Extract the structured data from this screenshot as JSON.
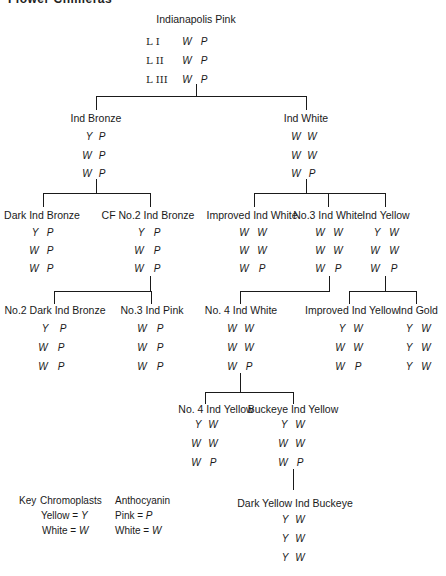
{
  "header": {
    "title": "Flower Chimeras"
  },
  "root": {
    "name": "Indianapolis Pink",
    "layers": [
      {
        "layer": "L I",
        "chromoplast": "W",
        "anthocyanin": "P"
      },
      {
        "layer": "L II",
        "chromoplast": "W",
        "anthocyanin": "P"
      },
      {
        "layer": "L III",
        "chromoplast": "W",
        "anthocyanin": "P"
      }
    ]
  },
  "nodes": {
    "ind_bronze": {
      "name": "Ind  Bronze",
      "rows": [
        [
          "Y",
          "P"
        ],
        [
          "W",
          "P"
        ],
        [
          "W",
          "P"
        ]
      ]
    },
    "ind_white": {
      "name": "Ind  White",
      "rows": [
        [
          "W",
          "W"
        ],
        [
          "W",
          "W"
        ],
        [
          "W",
          "P"
        ]
      ]
    },
    "dark_ind_bronze": {
      "name": "Dark Ind Bronze",
      "rows": [
        [
          "Y",
          "P"
        ],
        [
          "W",
          "P"
        ],
        [
          "W",
          "P"
        ]
      ]
    },
    "cf_no2_ind_bronze": {
      "name": "CF No.2  Ind  Bronze",
      "rows": [
        [
          "Y",
          "P"
        ],
        [
          "W",
          "P"
        ],
        [
          "W",
          "P"
        ]
      ]
    },
    "improved_ind_white": {
      "name": "Improved Ind White",
      "rows": [
        [
          "W",
          "W"
        ],
        [
          "W",
          "W"
        ],
        [
          "W",
          "P"
        ]
      ]
    },
    "no3_ind_white": {
      "name": "No.3 Ind White",
      "rows": [
        [
          "W",
          "W"
        ],
        [
          "W",
          "W"
        ],
        [
          "W",
          "P"
        ]
      ]
    },
    "ind_yellow": {
      "name": "Ind  Yellow",
      "rows": [
        [
          "Y",
          "W"
        ],
        [
          "W",
          "W"
        ],
        [
          "W",
          "P"
        ]
      ]
    },
    "no2_dark_ind_bronze": {
      "name": "No.2 Dark Ind Bronze",
      "rows": [
        [
          "Y",
          "P"
        ],
        [
          "W",
          "P"
        ],
        [
          "W",
          "P"
        ]
      ]
    },
    "no3_ind_pink": {
      "name": "No.3  Ind  Pink",
      "rows": [
        [
          "W",
          "P"
        ],
        [
          "W",
          "P"
        ],
        [
          "W",
          "P"
        ]
      ]
    },
    "no4_ind_white": {
      "name": "No. 4  Ind  White",
      "rows": [
        [
          "W",
          "W"
        ],
        [
          "W",
          "W"
        ],
        [
          "W",
          "P"
        ]
      ]
    },
    "improved_ind_yellow": {
      "name": "Improved Ind Yellow",
      "rows": [
        [
          "Y",
          "W"
        ],
        [
          "W",
          "W"
        ],
        [
          "W",
          "P"
        ]
      ]
    },
    "ind_gold": {
      "name": "Ind Gold",
      "rows": [
        [
          "Y",
          "W"
        ],
        [
          "Y",
          "W"
        ],
        [
          "Y",
          "W"
        ]
      ]
    },
    "no4_ind_yellow": {
      "name": "No. 4  Ind  Yellow",
      "rows": [
        [
          "Y",
          "W"
        ],
        [
          "W",
          "W"
        ],
        [
          "W",
          "P"
        ]
      ]
    },
    "buckeye_ind_yellow": {
      "name": "Buckeye Ind Yellow",
      "rows": [
        [
          "Y",
          "W"
        ],
        [
          "W",
          "W"
        ],
        [
          "W",
          "P"
        ]
      ]
    },
    "dark_yellow_ind_buckeye": {
      "name": "Dark Yellow Ind Buckeye",
      "rows": [
        [
          "Y",
          "W"
        ],
        [
          "Y",
          "W"
        ],
        [
          "Y",
          "W"
        ]
      ]
    }
  },
  "key": {
    "title": "Key",
    "chromoplasts": {
      "heading": "Chromoplasts",
      "yellow": "Yellow = ",
      "yellow_sym": "Y",
      "white": "White = ",
      "white_sym": "W"
    },
    "anthocyanin": {
      "heading": "Anthocyanin",
      "pink": "Pink = ",
      "pink_sym": "P",
      "white": "White = ",
      "white_sym": "W"
    }
  }
}
